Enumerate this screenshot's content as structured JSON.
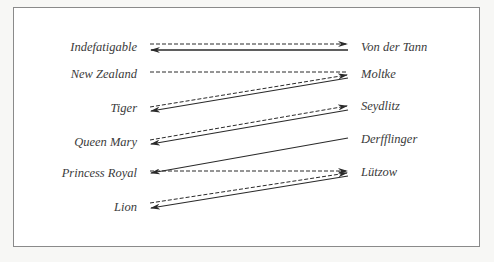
{
  "diagram": {
    "title": "",
    "left_column": {
      "side": "British",
      "ships": [
        {
          "name": "Indefatigable",
          "y": 47
        },
        {
          "name": "New Zealand",
          "y": 75
        },
        {
          "name": "Tiger",
          "y": 108
        },
        {
          "name": "Queen Mary",
          "y": 142
        },
        {
          "name": "Princess Royal",
          "y": 173
        },
        {
          "name": "Lion",
          "y": 206
        }
      ]
    },
    "right_column": {
      "side": "German",
      "ships": [
        {
          "name": "Von der Tann",
          "y": 47
        },
        {
          "name": "Moltke",
          "y": 74
        },
        {
          "name": "Seydlitz",
          "y": 106
        },
        {
          "name": "Derfflinger",
          "y": 139
        },
        {
          "name": "Lützow",
          "y": 172
        }
      ]
    },
    "legend": {
      "dashed": "British fire (left → right)",
      "solid": "German fire (right → left)"
    },
    "links": [
      {
        "from": "Indefatigable",
        "to": "Von der Tann",
        "style": "dashed",
        "arrow": "right"
      },
      {
        "from": "Von der Tann",
        "to": "Indefatigable",
        "style": "solid",
        "arrow": "left"
      },
      {
        "from": "New Zealand",
        "to": "Moltke",
        "style": "dashed",
        "arrow": "none"
      },
      {
        "from": "Tiger",
        "to": "Moltke",
        "style": "dashed",
        "arrow": "right"
      },
      {
        "from": "Moltke",
        "to": "Tiger",
        "style": "solid",
        "arrow": "left"
      },
      {
        "from": "Queen Mary",
        "to": "Seydlitz",
        "style": "dashed",
        "arrow": "right"
      },
      {
        "from": "Seydlitz",
        "to": "Queen Mary",
        "style": "solid",
        "arrow": "left"
      },
      {
        "from": "Derfflinger",
        "to": "Princess Royal",
        "style": "solid",
        "arrow": "left"
      },
      {
        "from": "Princess Royal",
        "to": "Lützow",
        "style": "dashed",
        "arrow": "right"
      },
      {
        "from": "Lion",
        "to": "Lützow",
        "style": "dashed",
        "arrow": "right"
      },
      {
        "from": "Lützow",
        "to": "Lion",
        "style": "solid",
        "arrow": "left"
      }
    ],
    "colors": {
      "line": "#2a2a2a",
      "text": "#3a3a3a",
      "frame": "#8a8a8a",
      "background": "#ffffff"
    }
  }
}
